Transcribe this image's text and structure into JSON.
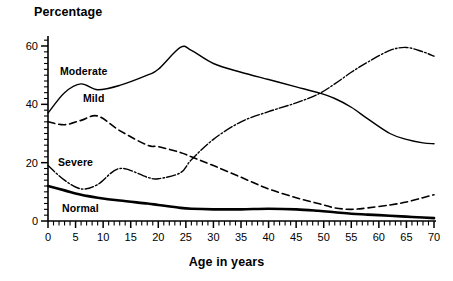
{
  "chart_data": {
    "type": "line",
    "title": "",
    "xlabel": "Age in years",
    "ylabel": "Percentage",
    "xlim": [
      0,
      70
    ],
    "ylim": [
      0,
      63
    ],
    "grid": false,
    "legend_position": "inline-labels",
    "xticks_major": [
      0,
      5,
      10,
      15,
      20,
      25,
      30,
      35,
      40,
      45,
      50,
      55,
      60,
      65,
      70
    ],
    "xticks_minor_step": 1,
    "yticks_major": [
      0,
      20,
      40,
      60
    ],
    "yticks_minor_step": 2,
    "x": [
      0,
      3,
      6,
      9,
      13,
      18,
      20,
      24,
      26,
      30,
      35,
      40,
      45,
      49,
      52,
      55,
      58,
      62,
      65,
      68,
      70
    ],
    "series": [
      {
        "name": "Moderate",
        "style": "solid-thin",
        "label_position": {
          "x": 60,
          "y": 65
        },
        "values": [
          37,
          44,
          47,
          45,
          46.5,
          50,
          52,
          59.5,
          58.5,
          54,
          51,
          48.5,
          46,
          44,
          42,
          39,
          35,
          30,
          28,
          26.8,
          26.5
        ]
      },
      {
        "name": "Mild",
        "style": "dashed",
        "label_position": {
          "x": 83,
          "y": 92
        },
        "values": [
          34,
          33,
          34.5,
          36,
          31,
          26,
          25.5,
          23.5,
          22,
          19,
          15,
          11,
          8,
          6,
          4.5,
          4,
          4.5,
          5.5,
          6.5,
          8,
          9
        ]
      },
      {
        "name": "Severe",
        "style": "dash-dot",
        "label_position": {
          "x": 58,
          "y": 156
        },
        "values": [
          19,
          14,
          11,
          12.5,
          18,
          15,
          14.5,
          16.5,
          21,
          28,
          34,
          37.5,
          40.5,
          43.5,
          47,
          51,
          54.5,
          58.5,
          59.5,
          58,
          56.5
        ]
      },
      {
        "name": "Normal",
        "style": "solid-thick",
        "label_position": {
          "x": 62,
          "y": 202
        },
        "values": [
          12,
          10.5,
          9,
          8,
          7,
          6,
          5.5,
          4.5,
          4.2,
          4,
          4,
          4.2,
          4,
          3.5,
          3,
          2.5,
          2.2,
          1.8,
          1.5,
          1.2,
          1
        ]
      }
    ]
  },
  "axes": {
    "y_tick_labels": [
      "60",
      "40",
      "20",
      "0"
    ],
    "x_tick_labels": [
      "0",
      "5",
      "10",
      "15",
      "20",
      "25",
      "30",
      "35",
      "40",
      "45",
      "50",
      "55",
      "60",
      "65",
      "70"
    ]
  },
  "colors": {
    "ink": "#000000",
    "background": "#ffffff"
  }
}
